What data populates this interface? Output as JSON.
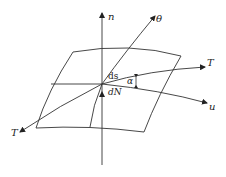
{
  "diagram": {
    "type": "surface-coordinate-diagram",
    "labels": {
      "n": "n",
      "theta": "θ",
      "T_right": "T",
      "T_left": "T",
      "u": "u",
      "ds": "ds",
      "dN": "dN",
      "alpha": "α"
    },
    "colors": {
      "line": "#333333",
      "background": "#ffffff"
    }
  }
}
